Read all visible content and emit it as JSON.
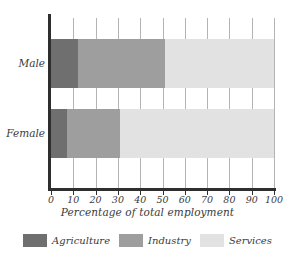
{
  "chart_data": {
    "type": "bar",
    "orientation": "horizontal",
    "stacked": true,
    "title": "",
    "xlabel": "Percentage of total employment",
    "ylabel": "",
    "xlim": [
      0,
      100
    ],
    "xticks": [
      0,
      10,
      20,
      30,
      40,
      50,
      60,
      70,
      80,
      90,
      100
    ],
    "xtick_labels": [
      "0",
      "10",
      "20",
      "30",
      "40",
      "50",
      "60",
      "70",
      "80",
      "90",
      "100"
    ],
    "grid": true,
    "legend_position": "bottom",
    "categories": [
      "Male",
      "Female"
    ],
    "series": [
      {
        "name": "Agriculture",
        "color": "#6f6f6f",
        "values": [
          12,
          7
        ]
      },
      {
        "name": "Industry",
        "color": "#9e9e9e",
        "values": [
          39,
          24
        ]
      },
      {
        "name": "Services",
        "color": "#e2e2e2",
        "values": [
          49,
          69
        ]
      }
    ],
    "cumulative_boundaries": {
      "Male": [
        12,
        51,
        100
      ],
      "Female": [
        7,
        31,
        100
      ]
    },
    "axis_color": "#2e2e2e",
    "gridline_color": "#b4b4b4",
    "background": "#ffffff"
  },
  "legend": {
    "items": [
      {
        "label": "Agriculture",
        "color": "#6f6f6f"
      },
      {
        "label": "Industry",
        "color": "#9e9e9e"
      },
      {
        "label": "Services",
        "color": "#e2e2e2"
      }
    ]
  }
}
